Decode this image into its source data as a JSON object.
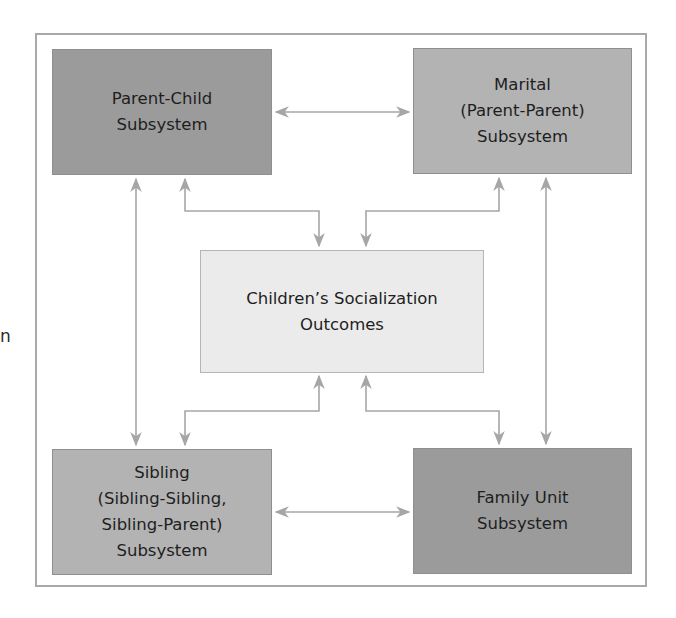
{
  "stray_text": "n",
  "colors": {
    "frame": "#a9a9a9",
    "arrow": "#a6a6a6",
    "box_dark": "#9b9b9b",
    "box_mid": "#b3b3b3",
    "box_light": "#ebebeb"
  },
  "nodes": {
    "parent_child": "Parent-Child\nSubsystem",
    "marital": "Marital\n(Parent-Parent)\nSubsystem",
    "center": "Children’s Socialization\nOutcomes",
    "sibling": "Sibling\n(Sibling-Sibling,\nSibling-Parent)\nSubsystem",
    "family_unit": "Family Unit\nSubsystem"
  },
  "edges": [
    {
      "from": "parent_child",
      "to": "marital",
      "type": "bidirectional"
    },
    {
      "from": "sibling",
      "to": "family_unit",
      "type": "bidirectional"
    },
    {
      "from": "parent_child",
      "to": "sibling",
      "type": "bidirectional"
    },
    {
      "from": "marital",
      "to": "family_unit",
      "type": "bidirectional"
    },
    {
      "from": "parent_child",
      "to": "center",
      "type": "bidirectional"
    },
    {
      "from": "marital",
      "to": "center",
      "type": "bidirectional"
    },
    {
      "from": "center",
      "to": "sibling",
      "type": "bidirectional"
    },
    {
      "from": "center",
      "to": "family_unit",
      "type": "bidirectional"
    }
  ]
}
